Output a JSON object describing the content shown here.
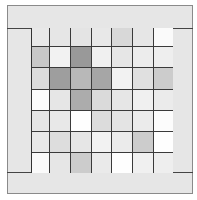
{
  "frame": {
    "fill": "#e6e6e6",
    "border": "#8a8a8a",
    "grid_line": "#3a3a3a"
  },
  "grid": {
    "rows": 7,
    "cols": 7,
    "cells": [
      [
        "#e8e8e8",
        "#e6e6e6",
        "#e4e4e4",
        "#e8e8e8",
        "#d8d8d8",
        "#e6e6e6",
        "#fafafa"
      ],
      [
        "#c8c8c8",
        "#f2f2f2",
        "#999999",
        "#f0f0f0",
        "#e6e6e6",
        "#ececec",
        "#eeeeee"
      ],
      [
        "#dcdcdc",
        "#9e9e9e",
        "#b8b8b8",
        "#a6a6a6",
        "#f2f2f2",
        "#e0e0e0",
        "#cccccc"
      ],
      [
        "#fcfcfc",
        "#e6e6e6",
        "#acacac",
        "#dadada",
        "#e6e6e6",
        "#f0f0f0",
        "#ebebeb"
      ],
      [
        "#e6e6e6",
        "#e8e8e8",
        "#fefefe",
        "#dcdcdc",
        "#e4e4e4",
        "#ebebeb",
        "#fcfcfc"
      ],
      [
        "#e8e8e8",
        "#dddddd",
        "#e6e6e6",
        "#f2f2f2",
        "#ebebeb",
        "#cccccc",
        "#fefefe"
      ],
      [
        "#fafafa",
        "#e6e6e6",
        "#cccccc",
        "#eaeaea",
        "#fefefe",
        "#f0f0f0",
        "#eeeeee"
      ]
    ]
  }
}
